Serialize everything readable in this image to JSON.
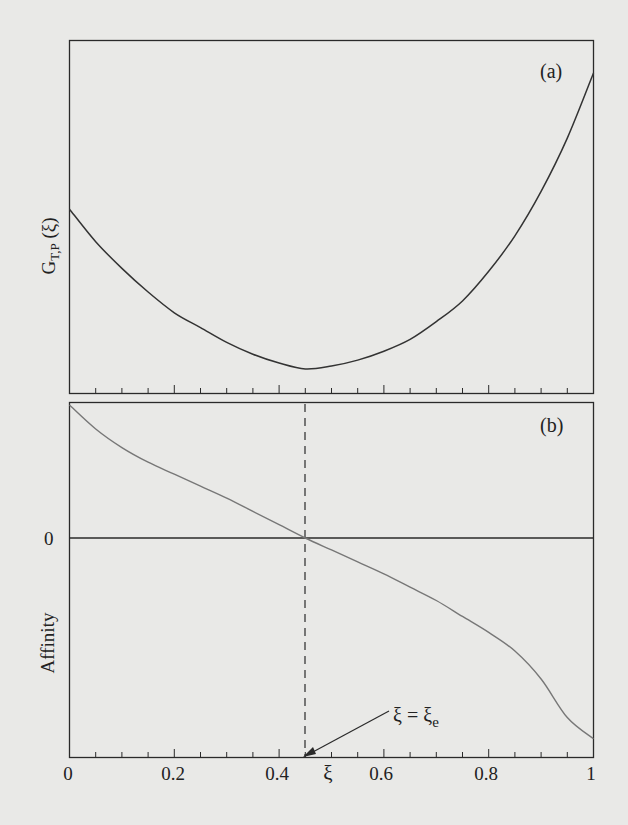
{
  "chart_data": [
    {
      "panel": "(a)",
      "type": "line",
      "title": "",
      "xlabel": "",
      "ylabel": "G_{T,P} (ξ)",
      "ylabel_main": "G",
      "ylabel_sub": "T,P",
      "ylabel_arg": " (ξ)",
      "xlim": [
        0,
        1
      ],
      "x_ticks_major": [
        0,
        0.2,
        0.4,
        0.6,
        0.8,
        1
      ],
      "x_ticks_minor_step": 0.05,
      "y_ticks": [],
      "grid": false,
      "series": [
        {
          "name": "G_{T,P}(ξ)",
          "x": [
            0,
            0.05,
            0.1,
            0.15,
            0.2,
            0.25,
            0.3,
            0.35,
            0.4,
            0.45,
            0.5,
            0.55,
            0.6,
            0.65,
            0.7,
            0.75,
            0.8,
            0.85,
            0.9,
            0.95,
            1.0
          ],
          "y_relative": [
            0.54,
            0.43,
            0.34,
            0.26,
            0.19,
            0.14,
            0.09,
            0.05,
            0.02,
            0.0,
            0.01,
            0.03,
            0.06,
            0.1,
            0.16,
            0.23,
            0.33,
            0.45,
            0.6,
            0.78,
            1.0
          ]
        }
      ],
      "annotations": [
        {
          "text": "minimum at ξ = ξe ≈ 0.45"
        }
      ]
    },
    {
      "panel": "(b)",
      "type": "line",
      "title": "",
      "xlabel": "ξ",
      "ylabel": "Affinity",
      "xlim": [
        0,
        1
      ],
      "x_ticks_major": [
        0,
        0.2,
        0.4,
        0.6,
        0.8,
        1
      ],
      "x_tick_labels": [
        "0",
        "0.2",
        "0.4",
        "0.6",
        "0.8",
        "1"
      ],
      "x_ticks_minor_step": 0.05,
      "y_ticks": [
        0
      ],
      "y_tick_labels": [
        "0"
      ],
      "grid": false,
      "series": [
        {
          "name": "Affinity",
          "x": [
            0,
            0.05,
            0.1,
            0.15,
            0.2,
            0.25,
            0.3,
            0.35,
            0.4,
            0.45,
            0.5,
            0.55,
            0.6,
            0.65,
            0.7,
            0.75,
            0.8,
            0.85,
            0.9,
            0.95,
            1.0
          ],
          "y_relative": [
            1.0,
            0.82,
            0.68,
            0.57,
            0.48,
            0.39,
            0.3,
            0.2,
            0.1,
            0.0,
            -0.09,
            -0.18,
            -0.27,
            -0.37,
            -0.47,
            -0.59,
            -0.71,
            -0.85,
            -1.06,
            -1.35,
            -1.51
          ]
        }
      ],
      "annotations": [
        {
          "text": "ξ = ξe",
          "lhs": "ξ = ξ",
          "sub": "e",
          "arrow_to_x": 0.45
        }
      ],
      "reference_lines": [
        {
          "type": "vertical",
          "x": 0.45,
          "style": "dashed",
          "spans": "both panels"
        },
        {
          "type": "horizontal",
          "y": 0,
          "style": "solid"
        }
      ]
    }
  ],
  "labels": {
    "panel_a": "(a)",
    "panel_b": "(b)",
    "y_a_main": "G",
    "y_a_sub": "T,P",
    "y_a_arg": " (ξ)",
    "y_b": "Affinity",
    "zero": "0",
    "x_axis": "ξ",
    "ticks": [
      "0",
      "0.2",
      "0.4",
      "0.6",
      "0.8",
      "1"
    ],
    "annot_lhs": "ξ = ξ",
    "annot_sub": "e"
  },
  "colors": {
    "background": "#e9e9e7",
    "axes": "#2a2a2a",
    "curve_a": "#333333",
    "curve_b": "#777777"
  }
}
